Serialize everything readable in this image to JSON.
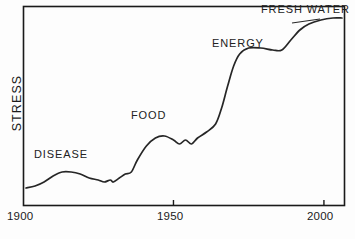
{
  "chart_data": {
    "type": "line",
    "title": "",
    "subtitle": "",
    "xlabel": "",
    "ylabel": "STRESS",
    "xlim": [
      1900,
      2007
    ],
    "ylim": [
      0,
      100
    ],
    "grid": false,
    "legend_position": "none",
    "x_ticks": [
      {
        "value": 1900,
        "label": "1900"
      },
      {
        "value": 1950,
        "label": "1950"
      },
      {
        "value": 2000,
        "label": "2000"
      }
    ],
    "y_ticks": [],
    "axis_note": "Y axis is unlabeled/qualitative; values are relative stress level 0-100",
    "annotations": [
      {
        "text": "DISEASE",
        "x": 1904,
        "y": 20
      },
      {
        "text": "FOOD",
        "x": 1937,
        "y": 39
      },
      {
        "text": "ENERGY",
        "x": 1964,
        "y": 79
      },
      {
        "text": "FRESH WATER",
        "x": 1987,
        "y": 97
      }
    ],
    "series": [
      {
        "name": "Stress",
        "color": "#262626",
        "points": [
          {
            "x": 1901,
            "y": 9
          },
          {
            "x": 1904,
            "y": 10
          },
          {
            "x": 1907,
            "y": 12
          },
          {
            "x": 1910,
            "y": 15
          },
          {
            "x": 1913,
            "y": 17
          },
          {
            "x": 1916,
            "y": 17
          },
          {
            "x": 1919,
            "y": 16
          },
          {
            "x": 1922,
            "y": 14
          },
          {
            "x": 1925,
            "y": 13
          },
          {
            "x": 1927,
            "y": 12
          },
          {
            "x": 1929,
            "y": 13
          },
          {
            "x": 1930,
            "y": 12
          },
          {
            "x": 1932,
            "y": 14
          },
          {
            "x": 1934,
            "y": 16
          },
          {
            "x": 1936,
            "y": 17
          },
          {
            "x": 1938,
            "y": 23
          },
          {
            "x": 1941,
            "y": 30
          },
          {
            "x": 1944,
            "y": 34
          },
          {
            "x": 1947,
            "y": 35
          },
          {
            "x": 1950,
            "y": 33
          },
          {
            "x": 1952,
            "y": 31
          },
          {
            "x": 1954,
            "y": 33
          },
          {
            "x": 1956,
            "y": 31
          },
          {
            "x": 1958,
            "y": 34
          },
          {
            "x": 1961,
            "y": 37
          },
          {
            "x": 1964,
            "y": 41
          },
          {
            "x": 1966,
            "y": 49
          },
          {
            "x": 1968,
            "y": 60
          },
          {
            "x": 1970,
            "y": 70
          },
          {
            "x": 1972,
            "y": 76
          },
          {
            "x": 1975,
            "y": 79
          },
          {
            "x": 1979,
            "y": 79
          },
          {
            "x": 1983,
            "y": 78
          },
          {
            "x": 1986,
            "y": 78
          },
          {
            "x": 1989,
            "y": 83
          },
          {
            "x": 1992,
            "y": 88
          },
          {
            "x": 1995,
            "y": 91
          },
          {
            "x": 1999,
            "y": 93
          },
          {
            "x": 2003,
            "y": 94
          },
          {
            "x": 2006,
            "y": 94
          }
        ]
      }
    ]
  },
  "frame": {
    "border_color": "#1a1a1a"
  }
}
